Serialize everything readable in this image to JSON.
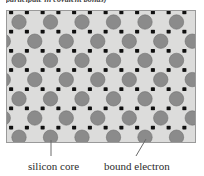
{
  "caption": {
    "top_text": "participate in covalent bonds)"
  },
  "figure": {
    "name": "silicon-crystal-lattice",
    "box": {
      "x": 6,
      "y": 10,
      "width": 190,
      "height": 133
    },
    "background_color": "#dcdcdb",
    "border_color": "#9a9a9a",
    "core": {
      "label": "silicon core",
      "color": "#8b8b8b",
      "stroke": "#707070",
      "radius": 7.2
    },
    "electron": {
      "label": "bound electron",
      "color": "#101010",
      "size": 3.4
    },
    "lattice": {
      "columns": 6,
      "rows": 7,
      "x_spacing": 31.5,
      "y_spacing": 19.2,
      "x_origin": 13,
      "y_origin": 12,
      "row_offset": 15.75
    }
  },
  "legend": {
    "silicon_core": "silicon core",
    "bound_electron": "bound electron",
    "leader_color": "#6a6a6a"
  },
  "leaders": {
    "silicon_core": {
      "x1": 51,
      "y1": 140,
      "x2": 51,
      "y2": 156
    },
    "bound_electron": {
      "x1": 146,
      "y1": 139,
      "x2": 136,
      "y2": 156
    }
  }
}
